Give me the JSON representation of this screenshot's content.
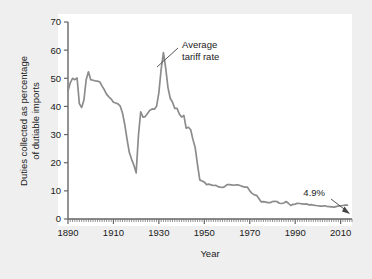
{
  "figure": {
    "background_color": "#efefef",
    "plot_background_color": "#ffffff",
    "axis_color": "#666666",
    "line_color": "#8c8c8c",
    "text_color": "#1a1a1a"
  },
  "chart_data": {
    "type": "line",
    "title": "",
    "subtitle": "",
    "xlabel": "Year",
    "ylabel": "Duties collected as percentage of dutiable imports",
    "ylabel_line1": "Duties collected as percentage",
    "ylabel_line2": "of dutiable imports",
    "xlim": [
      1890,
      2015
    ],
    "ylim": [
      0,
      70
    ],
    "xticks": [
      1890,
      1910,
      1930,
      1950,
      1970,
      1990,
      2010
    ],
    "xtick_labels": [
      "1890",
      "1910",
      "1930",
      "1950",
      "1970",
      "1990",
      "2010"
    ],
    "yticks": [
      0,
      10,
      20,
      30,
      40,
      50,
      60,
      70
    ],
    "ytick_labels": [
      "0",
      "10",
      "20",
      "30",
      "40",
      "50",
      "60",
      "70"
    ],
    "minor_xtick_interval": 1,
    "grid": false,
    "legend_position": "none",
    "series": [
      {
        "name": "Average tariff rate",
        "x": [
          1890,
          1891,
          1892,
          1893,
          1894,
          1895,
          1896,
          1897,
          1898,
          1899,
          1900,
          1901,
          1902,
          1903,
          1904,
          1905,
          1906,
          1907,
          1908,
          1909,
          1910,
          1911,
          1912,
          1913,
          1914,
          1915,
          1916,
          1917,
          1918,
          1919,
          1920,
          1921,
          1922,
          1923,
          1924,
          1925,
          1926,
          1927,
          1928,
          1929,
          1930,
          1931,
          1932,
          1933,
          1934,
          1935,
          1936,
          1937,
          1938,
          1939,
          1940,
          1941,
          1942,
          1943,
          1944,
          1945,
          1946,
          1947,
          1948,
          1949,
          1950,
          1951,
          1952,
          1953,
          1954,
          1955,
          1956,
          1957,
          1958,
          1959,
          1960,
          1961,
          1962,
          1963,
          1964,
          1965,
          1966,
          1967,
          1968,
          1969,
          1970,
          1971,
          1972,
          1973,
          1974,
          1975,
          1976,
          1977,
          1978,
          1979,
          1980,
          1981,
          1982,
          1983,
          1984,
          1985,
          1986,
          1987,
          1988,
          1989,
          1990,
          1991,
          1992,
          1993,
          1994,
          1995,
          1996,
          1997,
          1998,
          1999,
          2000,
          2001,
          2002,
          2003,
          2004,
          2005,
          2006,
          2007,
          2008,
          2009,
          2010,
          2011,
          2012,
          2013
        ],
        "values": [
          45.5,
          48.4,
          50.0,
          49.5,
          50.1,
          41.0,
          39.6,
          42.2,
          49.5,
          52.3,
          49.5,
          49.3,
          49.1,
          49.0,
          48.7,
          47.2,
          45.9,
          44.3,
          43.4,
          42.6,
          41.5,
          41.2,
          40.9,
          40.1,
          37.6,
          33.5,
          28.3,
          23.6,
          21.2,
          19.1,
          16.4,
          29.6,
          38.1,
          36.2,
          36.4,
          37.5,
          38.6,
          39.1,
          39.0,
          40.1,
          44.9,
          53.2,
          59.1,
          53.6,
          46.7,
          42.9,
          41.5,
          39.3,
          39.3,
          37.3,
          36.2,
          36.8,
          32.3,
          32.6,
          31.7,
          28.2,
          25.3,
          19.3,
          13.9,
          13.5,
          13.1,
          12.2,
          12.4,
          12.1,
          11.9,
          12.0,
          11.5,
          11.3,
          11.2,
          11.5,
          12.2,
          12.2,
          12.1,
          12.0,
          12.1,
          12.1,
          11.8,
          11.5,
          11.3,
          11.3,
          10.0,
          9.1,
          8.6,
          8.4,
          7.3,
          6.1,
          6.2,
          6.0,
          5.8,
          5.8,
          6.2,
          6.3,
          6.2,
          5.6,
          5.5,
          5.7,
          6.2,
          5.6,
          4.8,
          5.2,
          5.3,
          5.6,
          5.5,
          5.4,
          5.3,
          5.4,
          5.0,
          5.1,
          4.9,
          4.8,
          4.7,
          4.6,
          4.6,
          4.7,
          4.5,
          4.4,
          4.3,
          4.2,
          4.4,
          4.6,
          4.7,
          4.8,
          4.9,
          4.9
        ]
      }
    ],
    "annotations": [
      {
        "id": "peak-annotation",
        "label_line1": "Average",
        "label_line2": "tariff rate",
        "points_to_year": 1931,
        "points_to_value": 56
      },
      {
        "id": "endpoint-annotation",
        "label": "4.9%",
        "points_to_year": 2013,
        "points_to_value": 4.9
      }
    ]
  }
}
